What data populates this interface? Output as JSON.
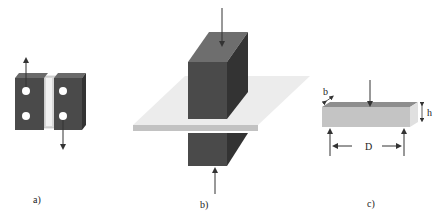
{
  "figure": {
    "panels": [
      {
        "id": "a",
        "caption": "a)",
        "description": "Two dark blocks joined by a light central strip with four holes; opposing up/down arrows (shear pull test)"
      },
      {
        "id": "b",
        "caption": "b)",
        "description": "Two dark blocks pressing a thin light plate from above and below; vertical arrows"
      },
      {
        "id": "c",
        "caption": "c)",
        "description": "Light rectangular beam on two supports with central load (three-point bending)"
      }
    ],
    "dimension_labels": {
      "width": "b",
      "height": "h",
      "span": "D"
    }
  },
  "colors": {
    "block_front": "#4a4a4a",
    "block_side": "#333333",
    "block_top": "#6e6e6e",
    "plate": "#e8e8e8",
    "plate_edge": "#bdbdbd",
    "beam_front": "#c4c4c4",
    "beam_top": "#8a8a8a",
    "arrow": "#333333"
  }
}
